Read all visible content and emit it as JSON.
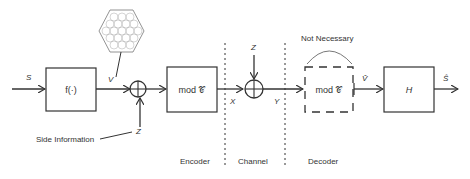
{
  "diagram": {
    "type": "block-diagram",
    "title": "",
    "signals": {
      "input": "S",
      "v": "V",
      "z_side": "Z",
      "x": "X",
      "z_channel": "Z",
      "y": "Y",
      "v_hat": "V̂",
      "s_hat": "Ŝ"
    },
    "blocks": {
      "f": "f(·)",
      "mod_encoder": "mod 𝒞",
      "mod_decoder": "mod 𝒞",
      "h": "H"
    },
    "annotations": {
      "side_information": "Side Information",
      "not_necessary": "Not Necessary"
    },
    "sections": {
      "encoder": "Encoder",
      "channel": "Channel",
      "decoder": "Decoder"
    },
    "colors": {
      "stroke": "#333333",
      "text": "#333333",
      "lattice": "#888888"
    }
  }
}
